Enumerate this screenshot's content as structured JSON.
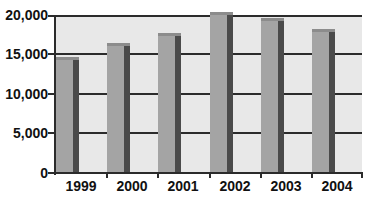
{
  "chart_data": {
    "type": "bar",
    "title": "",
    "xlabel": "",
    "ylabel": "",
    "categories": [
      "1999",
      "2000",
      "2001",
      "2002",
      "2003",
      "2004"
    ],
    "values": [
      14400,
      16200,
      17500,
      20100,
      19400,
      18000
    ],
    "ylim": [
      0,
      20000
    ],
    "yticks": [
      0,
      5000,
      10000,
      15000,
      20000
    ],
    "ytick_labels": [
      "0",
      "5,000",
      "10,000",
      "15,000",
      "20,000"
    ],
    "grid": true,
    "legend": null,
    "style": "3d-column",
    "colors": {
      "bar_front": "#a4a4a4",
      "bar_side": "#4a4a4a",
      "plot_bg": "#e8e8e8",
      "grid": "#2b2b2b"
    }
  }
}
